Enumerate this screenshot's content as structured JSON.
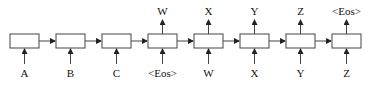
{
  "diagram": {
    "cells": [
      {
        "input": "A",
        "output": null
      },
      {
        "input": "B",
        "output": null
      },
      {
        "input": "C",
        "output": null
      },
      {
        "input": "<Eos>",
        "output": "W"
      },
      {
        "input": "W",
        "output": "X"
      },
      {
        "input": "X",
        "output": "Y"
      },
      {
        "input": "Y",
        "output": "Z"
      },
      {
        "input": "Z",
        "output": "<Eos>"
      }
    ],
    "colors": {
      "stroke": "#333333",
      "text": "#111111",
      "box_fill": "#ffffff"
    }
  }
}
